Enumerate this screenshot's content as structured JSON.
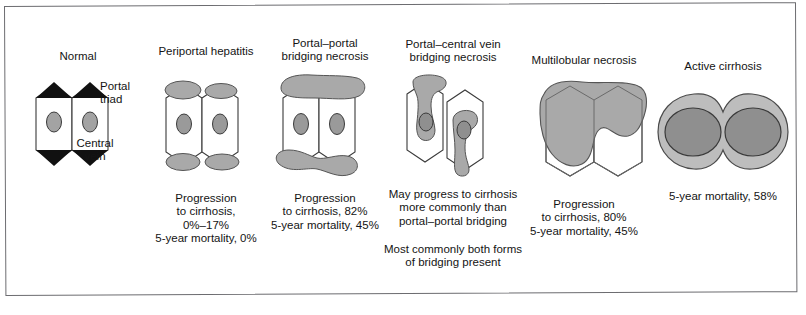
{
  "figure": {
    "type": "medical-diagram",
    "frame_color": "#6c6c70",
    "background": "#ffffff",
    "fill_gray": "#a9a9a9",
    "nucleus_gray": "#9a9a9a",
    "outline": "#3a3a3a"
  },
  "panels": [
    {
      "id": "normal",
      "title": "Normal",
      "labels": [
        {
          "name": "portal-triad-label",
          "text": "Portal\ntriad"
        },
        {
          "name": "central-vein-label",
          "text": "Central\nvein"
        }
      ],
      "caption": ""
    },
    {
      "id": "periportal-hepatitis",
      "title": "Periportal hepatitis",
      "labels": [],
      "caption": "Progression\nto cirrhosis,\n0%–17%\n5-year mortality, 0%"
    },
    {
      "id": "portal-portal-bridging-necrosis",
      "title": "Portal–portal\nbridging necrosis",
      "labels": [],
      "caption": "Progression\nto cirrhosis,  82%\n5-year mortality, 45%"
    },
    {
      "id": "portal-central-vein-bridging-necrosis",
      "title": "Portal–central vein\nbridging necrosis",
      "labels": [],
      "caption": "May progress to cirrhosis\nmore commonly than\nportal–portal bridging",
      "caption2": "Most commonly both forms\nof bridging present"
    },
    {
      "id": "multilobular-necrosis",
      "title": "Multilobular necrosis",
      "labels": [],
      "caption": "Progression\nto cirrhosis, 80%\n5-year mortality, 45%"
    },
    {
      "id": "active-cirrhosis",
      "title": "Active cirrhosis",
      "labels": [],
      "caption": "5-year mortality, 58%"
    }
  ]
}
